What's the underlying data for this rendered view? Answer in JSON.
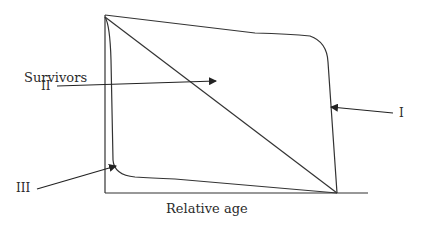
{
  "diagram": {
    "y_axis_label": "Survivors",
    "x_axis_label": "Relative age",
    "curves": [
      {
        "id": "I",
        "label": "I",
        "description": "Type I: high survival until late life, then steep decline"
      },
      {
        "id": "II",
        "label": "II",
        "description": "Type II: constant mortality, straight diagonal line"
      },
      {
        "id": "III",
        "label": "III",
        "description": "Type III: steep early decline, then low steady survival"
      }
    ],
    "colors": {
      "line": "#333333",
      "text": "#2a2a2a",
      "background": "#ffffff"
    }
  }
}
